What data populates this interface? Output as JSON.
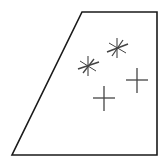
{
  "figure": {
    "background_color": "#ffffff",
    "width": 165,
    "height": 162
  },
  "shape": {
    "name": "trapezoid-outline",
    "kind": "quadrilateral",
    "stroke_color": "#1a1a1a",
    "fill_color": "#ffffff",
    "stroke_width": 1.6,
    "points": "82,12 157,12 157,155 12,155",
    "vertices": [
      {
        "label": "top-left",
        "x": 82,
        "y": 12
      },
      {
        "label": "top-right",
        "x": 157,
        "y": 12
      },
      {
        "label": "bottom-right",
        "x": 157,
        "y": 155
      },
      {
        "label": "bottom-left",
        "x": 12,
        "y": 155
      }
    ],
    "edges": [
      {
        "label": "top-edge",
        "from": "top-left",
        "to": "top-right"
      },
      {
        "label": "right-edge",
        "from": "top-right",
        "to": "bottom-right"
      },
      {
        "label": "bottom-edge",
        "from": "bottom-right",
        "to": "bottom-left"
      },
      {
        "label": "left-slanted-edge",
        "from": "bottom-left",
        "to": "top-left"
      }
    ]
  },
  "marks": {
    "stroke_color": "#444444",
    "count": 4,
    "items": [
      {
        "name": "mark-asterisk-upper-right",
        "style": "asterisk",
        "x": 117,
        "y": 48,
        "strokes": [
          {
            "x1": 107,
            "y1": 52,
            "x2": 128,
            "y2": 44,
            "width": 1.5
          },
          {
            "x1": 112,
            "y1": 56,
            "x2": 123,
            "y2": 40,
            "width": 1.3
          },
          {
            "x1": 117,
            "y1": 58,
            "x2": 117,
            "y2": 38,
            "width": 1.1
          },
          {
            "x1": 109,
            "y1": 43,
            "x2": 126,
            "y2": 53,
            "width": 1.0
          }
        ]
      },
      {
        "name": "mark-asterisk-left",
        "style": "asterisk",
        "x": 88,
        "y": 66,
        "strokes": [
          {
            "x1": 78,
            "y1": 69,
            "x2": 99,
            "y2": 62,
            "width": 1.5
          },
          {
            "x1": 83,
            "y1": 73,
            "x2": 94,
            "y2": 59,
            "width": 1.3
          },
          {
            "x1": 88,
            "y1": 76,
            "x2": 88,
            "y2": 56,
            "width": 1.1
          },
          {
            "x1": 80,
            "y1": 61,
            "x2": 96,
            "y2": 71,
            "width": 1.0
          }
        ]
      },
      {
        "name": "mark-plus-right",
        "style": "plus",
        "x": 137,
        "y": 80,
        "strokes": [
          {
            "x1": 126,
            "y1": 80,
            "x2": 148,
            "y2": 80,
            "width": 1.3
          },
          {
            "x1": 137,
            "y1": 68,
            "x2": 137,
            "y2": 93,
            "width": 1.3
          }
        ]
      },
      {
        "name": "mark-plus-lower",
        "style": "plus",
        "x": 104,
        "y": 98,
        "strokes": [
          {
            "x1": 93,
            "y1": 98,
            "x2": 115,
            "y2": 98,
            "width": 1.3
          },
          {
            "x1": 104,
            "y1": 86,
            "x2": 104,
            "y2": 111,
            "width": 1.3
          }
        ]
      }
    ]
  }
}
